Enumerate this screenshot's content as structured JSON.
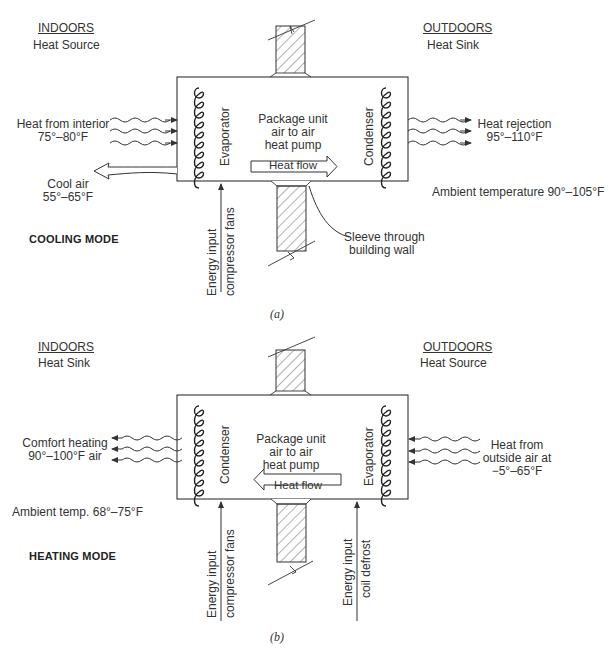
{
  "figure_a": {
    "caption": "(a)",
    "mode_label": "COOLING MODE",
    "indoors": {
      "title": "INDOORS",
      "role": "Heat Source"
    },
    "outdoors": {
      "title": "OUTDOORS",
      "role": "Heat Sink"
    },
    "unit": {
      "line1": "Package unit",
      "line2": "air to air",
      "line3": "heat pump"
    },
    "left_coil": "Evaporator",
    "right_coil": "Condenser",
    "heat_flow": {
      "label": "Heat flow",
      "direction": "right"
    },
    "heat_in": {
      "line1": "Heat from interior",
      "line2": "75°–80°F"
    },
    "heat_out": {
      "line1": "Heat rejection",
      "line2": "95°–110°F"
    },
    "cool_air": {
      "line1": "Cool air",
      "line2": "55°–65°F"
    },
    "ambient": "Ambient temperature 90°–105°F",
    "sleeve": {
      "line1": "Sleeve through",
      "line2": "building wall"
    },
    "energy_input": {
      "line1": "Energy input",
      "line2": "compressor fans"
    }
  },
  "figure_b": {
    "caption": "(b)",
    "mode_label": "HEATING MODE",
    "indoors": {
      "title": "INDOORS",
      "role": "Heat Sink"
    },
    "outdoors": {
      "title": "OUTDOORS",
      "role": "Heat Source"
    },
    "unit": {
      "line1": "Package unit",
      "line2": "air to air",
      "line3": "heat pump"
    },
    "left_coil": "Condenser",
    "right_coil": "Evaporator",
    "heat_flow": {
      "label": "Heat flow",
      "direction": "left"
    },
    "heat_out": {
      "line1": "Comfort heating",
      "line2": "90°–100°F air"
    },
    "heat_in": {
      "line1": "Heat from",
      "line2": "outside air at",
      "line3": "−5°–65°F"
    },
    "ambient": "Ambient temp. 68°–75°F",
    "energy_input_1": {
      "line1": "Energy input",
      "line2": "compressor fans"
    },
    "energy_input_2": {
      "line1": "Energy input",
      "line2": "coil defrost"
    }
  }
}
